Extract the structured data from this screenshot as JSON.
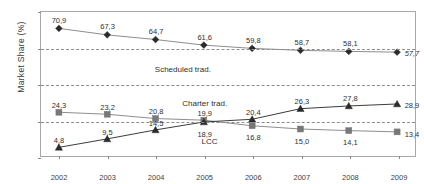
{
  "chart_data": {
    "type": "line",
    "title": "",
    "xlabel": "",
    "ylabel": "Market Share (%)",
    "categories": [
      "2002",
      "2003",
      "2004",
      "2005",
      "2006",
      "2007",
      "2008",
      "2009"
    ],
    "ylim": [
      0,
      80
    ],
    "yticks": [
      "0",
      "20",
      "40",
      "60",
      "80"
    ],
    "grid": "horizontal dashed gridlines at 20, 40, 60",
    "legend_position": "inline labels inside plot area",
    "series": [
      {
        "name": "Scheduled trad.",
        "marker": "diamond",
        "color": "#2b2b2b",
        "line_color": "#8c8c8c",
        "values": [
          70.9,
          67.3,
          64.7,
          61.6,
          59.8,
          58.7,
          58.1,
          57.7
        ],
        "labels": [
          "70,9",
          "67,3",
          "64,7",
          "61,6",
          "59,8",
          "58,7",
          "58,1",
          "57,7"
        ]
      },
      {
        "name": "Charter trad.",
        "marker": "square",
        "color": "#787878",
        "line_color": "#8c8c8c",
        "values": [
          24.3,
          23.2,
          20.8,
          19.9,
          16.8,
          15.0,
          14.1,
          13.4
        ],
        "labels": [
          "24,3",
          "23,2",
          "20,8",
          "19,9",
          "16,8",
          "15,0",
          "14,1",
          "13,4"
        ]
      },
      {
        "name": "LCC",
        "marker": "triangle",
        "color": "#2b2b2b",
        "line_color": "#3a3a3a",
        "values": [
          4.8,
          9.5,
          14.5,
          18.9,
          20.4,
          26.3,
          27.8,
          28.9
        ],
        "labels": [
          "4,8",
          "9,5",
          "14,5",
          "18,9",
          "20,4",
          "26,3",
          "27,8",
          "28,9"
        ]
      }
    ],
    "inline_labels": [
      {
        "text": "Scheduled trad.",
        "x_index": 2.55,
        "y_value": 48.5
      },
      {
        "text": "Charter trad.",
        "x_index": 3.0,
        "y_value": 30.2
      },
      {
        "text": "LCC",
        "x_index": 3.1,
        "y_value": 9.4
      }
    ]
  }
}
